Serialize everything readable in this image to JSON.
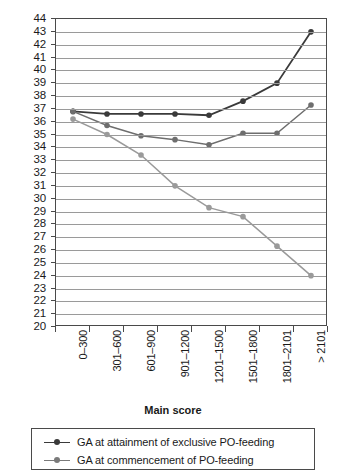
{
  "chart_data": {
    "type": "line",
    "title": "",
    "xlabel": "Main score",
    "ylabel": "GA at attainment of milestones (weeks)",
    "categories": [
      "0–300",
      "301–600",
      "601–900",
      "901–1200",
      "1201–1500",
      "1501–1800",
      "1801–2101",
      "> 2101"
    ],
    "ylim": [
      20,
      44
    ],
    "ytick_labels": [
      "44",
      "43",
      "42",
      "41",
      "40",
      "39",
      "38",
      "37",
      "36",
      "35",
      "34",
      "33",
      "32",
      "31",
      "30",
      "29",
      "28",
      "27",
      "26",
      "25",
      "24",
      "23",
      "22",
      "21",
      "20"
    ],
    "grid": true,
    "legend_position": "below-plot",
    "series": [
      {
        "name": "GA at attainment of exclusive PO-feeding",
        "color": "#3a3a3a",
        "values": [
          36.8,
          36.6,
          36.6,
          36.6,
          36.5,
          37.6,
          39.0,
          43.0
        ]
      },
      {
        "name": "GA at commencement of PO-feeding",
        "color": "#6e6e6e",
        "values": [
          36.8,
          35.7,
          34.9,
          34.6,
          34.2,
          35.1,
          35.1,
          37.3
        ]
      },
      {
        "name": "",
        "color": "#9a9a9a",
        "values": [
          36.2,
          35.0,
          33.4,
          31.0,
          29.3,
          28.6,
          26.3,
          24.0
        ]
      }
    ]
  },
  "legend": {
    "entries": [
      {
        "label": "GA at attainment of exclusive PO-feeding",
        "color": "#3a3a3a"
      },
      {
        "label": "GA at commencement of PO-feeding",
        "color": "#7a7a7a"
      }
    ]
  }
}
